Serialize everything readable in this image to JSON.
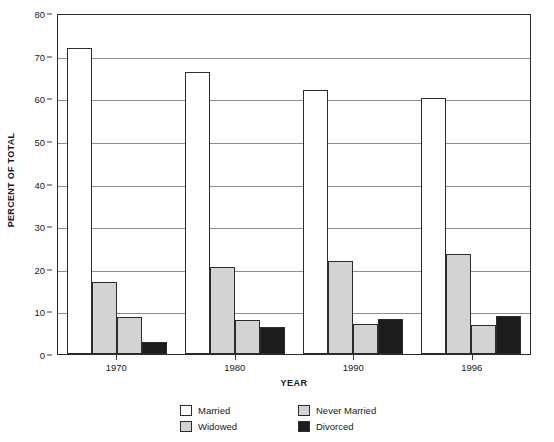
{
  "chart_data": {
    "type": "bar",
    "title": "",
    "xlabel": "YEAR",
    "ylabel": "PERCENT OF TOTAL",
    "ylim": [
      0,
      80
    ],
    "yticks": [
      0,
      10,
      20,
      30,
      40,
      50,
      60,
      70,
      80
    ],
    "grid": true,
    "legend_position": "bottom",
    "categories": [
      "1970",
      "1980",
      "1990",
      "1996"
    ],
    "series": [
      {
        "name": "Married",
        "color": "#ffffff",
        "values": [
          71.7,
          66.1,
          61.9,
          60.1
        ]
      },
      {
        "name": "Widowed",
        "color": "#d3d3d3",
        "values": [
          17.0,
          20.3,
          21.8,
          23.5
        ]
      },
      {
        "name": "Never Married",
        "color": "#d3d3d3",
        "values": [
          8.6,
          8.0,
          7.1,
          6.8
        ]
      },
      {
        "name": "Divorced",
        "color": "#1c1c1c",
        "values": [
          2.9,
          6.3,
          8.1,
          9.0
        ]
      }
    ]
  },
  "legend": {
    "items": [
      {
        "label": "Married",
        "swatch": "married"
      },
      {
        "label": "Never Married",
        "swatch": "nevermarried"
      },
      {
        "label": "Widowed",
        "swatch": "widowed"
      },
      {
        "label": "Divorced",
        "swatch": "divorced"
      }
    ]
  }
}
